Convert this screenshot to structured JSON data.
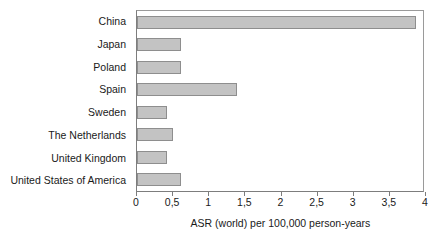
{
  "chart_data": {
    "type": "bar",
    "orientation": "horizontal",
    "title": "",
    "xlabel": "ASR (world) per 100,000 person-years",
    "ylabel": "",
    "categories": [
      "China",
      "Japan",
      "Poland",
      "Spain",
      "Sweden",
      "The Netherlands",
      "United Kingdom",
      "United States of America"
    ],
    "values": [
      3.9,
      0.61,
      0.61,
      1.4,
      0.42,
      0.5,
      0.42,
      0.61
    ],
    "xlim": [
      0,
      4
    ],
    "xticks": [
      0,
      0.5,
      1,
      1.5,
      2,
      2.5,
      3,
      3.5,
      4
    ],
    "xtick_labels": [
      "0",
      "0,5",
      "1",
      "1,5",
      "2",
      "2,5",
      "3",
      "3,5",
      "4"
    ],
    "grid": false,
    "legend": null,
    "bar_color": "#c3c3c3",
    "bar_border_color": "#8e8e8e",
    "axis_color": "#7d7d7d",
    "background": "#ffffff"
  }
}
